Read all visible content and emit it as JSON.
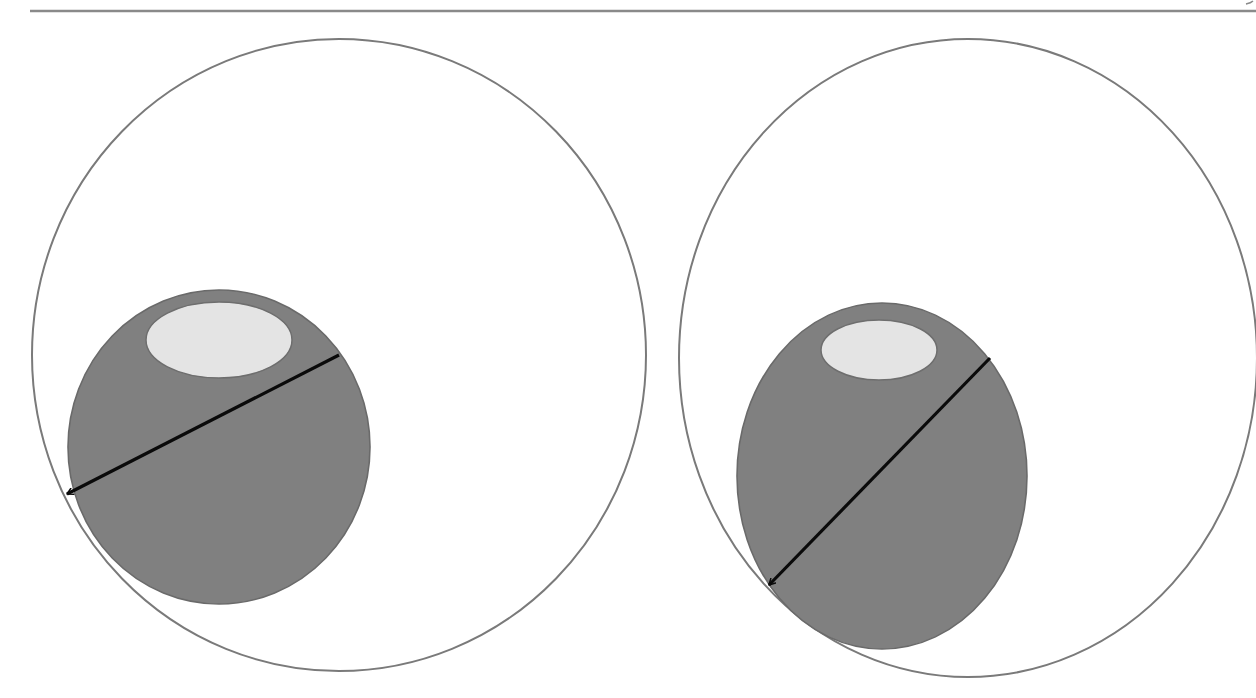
{
  "diagram": {
    "type": "schematic",
    "background": "#ffffff",
    "colors": {
      "outline": "#7a7a7a",
      "inner_fill": "#808080",
      "inner_stroke": "#6a6a6a",
      "highlight_fill": "#e4e4e4",
      "highlight_stroke": "#6e6e6e",
      "arrow": "#0a0a0a",
      "rule": "#8a8a8a"
    },
    "top_rule": {
      "x1": 30,
      "x2": 1256,
      "y": 11
    },
    "panels": [
      {
        "id": "left",
        "outer": {
          "cx": 339,
          "cy": 355,
          "rx": 307,
          "ry": 316
        },
        "inner": {
          "cx": 219,
          "cy": 447,
          "rx": 151,
          "ry": 157
        },
        "highlight": {
          "cx": 219,
          "cy": 340,
          "rx": 73,
          "ry": 38
        },
        "arrow": {
          "x1": 339,
          "y1": 355,
          "x2": 67,
          "y2": 494
        }
      },
      {
        "id": "right",
        "outer": {
          "cx": 968,
          "cy": 358,
          "rx": 289,
          "ry": 319
        },
        "inner": {
          "cx": 882,
          "cy": 476,
          "rx": 145,
          "ry": 173
        },
        "highlight": {
          "cx": 879,
          "cy": 350,
          "rx": 58,
          "ry": 30
        },
        "arrow": {
          "x1": 990,
          "y1": 358,
          "x2": 769,
          "y2": 585
        }
      }
    ]
  }
}
